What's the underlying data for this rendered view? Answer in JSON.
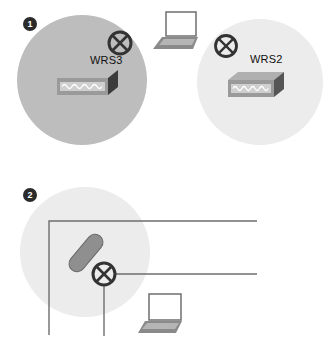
{
  "figure": {
    "colors": {
      "coverage_active": "#bdbdbd",
      "coverage_inactive": "#ececec",
      "badge": "#2b2b2b",
      "line": "#6e6e6e",
      "device_dark": "#444444",
      "pill": "#8f8f8f"
    },
    "panels": [
      {
        "badge": "1",
        "devices": [
          {
            "type": "wireless-router",
            "label": "WRS3",
            "coverage": "active"
          },
          {
            "type": "wireless-router",
            "label": "WRS2",
            "coverage": "inactive"
          }
        ],
        "client": {
          "type": "laptop"
        },
        "antenna_icons": [
          "access-point-symbol",
          "access-point-symbol"
        ]
      },
      {
        "badge": "2",
        "devices": [
          {
            "type": "access-point-symbol"
          },
          {
            "type": "ceiling-antenna"
          }
        ],
        "client": {
          "type": "laptop"
        },
        "cabling": "wired-backbone-lines"
      }
    ]
  }
}
